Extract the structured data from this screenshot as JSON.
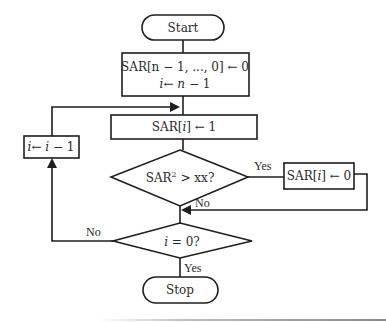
{
  "flowchart": {
    "start": {
      "label": "Start"
    },
    "init": {
      "line1": "SAR[n − 1, ..., 0] ← 0",
      "line2_var": "i",
      "line2_op": "← ",
      "line2_expr": "n",
      "line2_rest": " − 1"
    },
    "set_bit": {
      "pre": "SAR[",
      "var": "i",
      "post": "] ← 1"
    },
    "compare": {
      "pre": "SAR",
      "sup": "2",
      "post": " > xx?"
    },
    "clear_bit": {
      "pre": "SAR[",
      "var": "i",
      "post": "] ← 0"
    },
    "decrement": {
      "var1": "i",
      "op": "← ",
      "var2": "i",
      "rest": " − 1"
    },
    "check_zero": {
      "var": "i",
      "post": " = 0?"
    },
    "stop": {
      "label": "Stop"
    },
    "edge_labels": {
      "compare_yes": "Yes",
      "compare_no": "No",
      "zero_no": "No",
      "zero_yes": "Yes"
    }
  }
}
